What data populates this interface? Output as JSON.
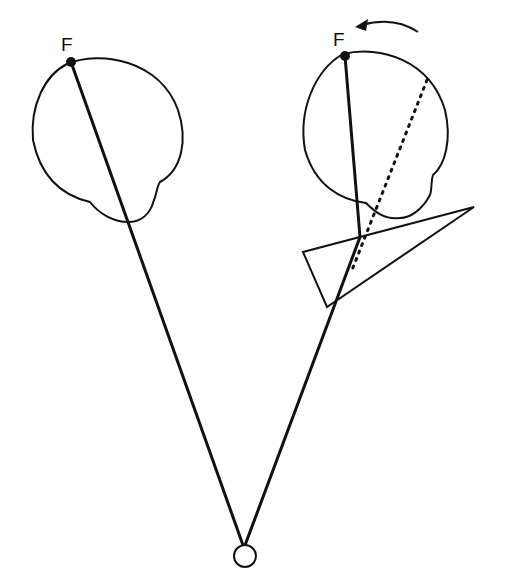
{
  "diagram": {
    "type": "optics-eye-prism",
    "left_eye": {
      "fixation_label": "F"
    },
    "right_eye": {
      "fixation_label": "F",
      "rotation_arrow": "counterclockwise"
    },
    "colors": {
      "stroke": "#111111",
      "background": "#ffffff"
    }
  }
}
